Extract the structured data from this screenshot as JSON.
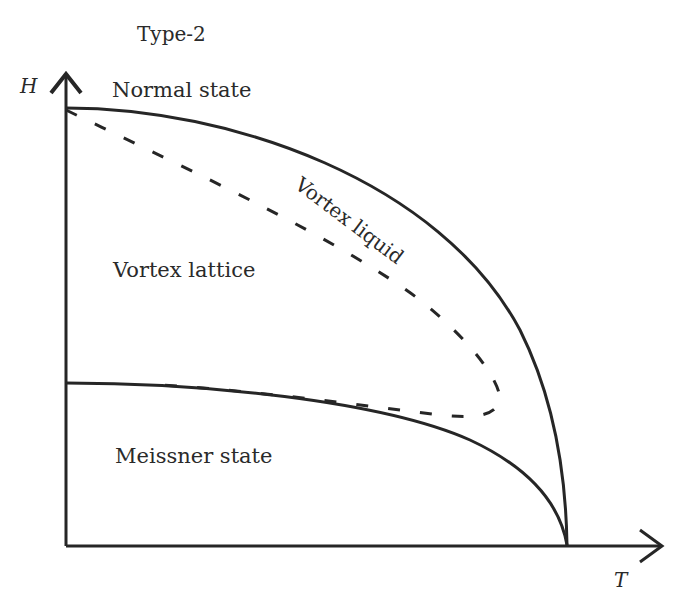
{
  "title": "Type-2",
  "axes": {
    "y_label": "H",
    "x_label": "T"
  },
  "regions": {
    "normal": "Normal state",
    "vortex_lattice": "Vortex lattice",
    "vortex_liquid": "Vortex liquid",
    "meissner": "Meissner state"
  },
  "colors": {
    "line": "#262626",
    "text": "#2a2a2a",
    "background": "#ffffff"
  },
  "curves": {
    "upper_critical_field": "solid, from H-axis top (66,108) to Tc (567,545)",
    "lower_critical_field": "solid, from H-axis (66,383) to Tc (567,545)",
    "melting_line": "dashed, from (66,108) bulging to (500,405) then back along lower curve"
  }
}
